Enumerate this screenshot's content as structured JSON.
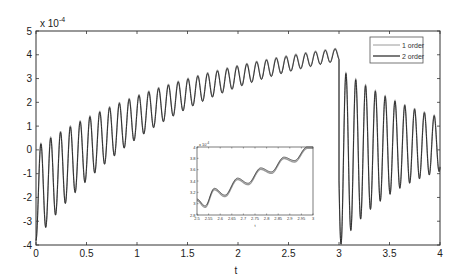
{
  "chart_data": [
    {
      "type": "line",
      "title": "",
      "xlabel": "t",
      "ylabel": "",
      "y_scale_label": "x 10",
      "y_scale_exponent": "-4",
      "xlim": [
        0,
        4
      ],
      "ylim": [
        -4,
        5
      ],
      "xticks": [
        "0",
        "0.5",
        "1",
        "1.5",
        "2",
        "2.5",
        "3",
        "3.5",
        "4"
      ],
      "yticks": [
        "-4",
        "-3",
        "-2",
        "-1",
        "0",
        "1",
        "2",
        "3",
        "4",
        "5"
      ],
      "grid": false,
      "legend_position": "upper right",
      "series": [
        {
          "name": "1 order",
          "color": "#9a9a9a",
          "description": "ramp with decaying ~10 Hz oscillation from t=0 to 3 (center ~-1.85 to 4.0), then step drop and damped oscillation about ~0 for t=3 to 4"
        },
        {
          "name": "2 order",
          "color": "#222222",
          "description": "nearly identical to 1 order"
        }
      ],
      "sample_points": {
        "t": [
          0.0,
          0.05,
          0.1,
          0.5,
          1.0,
          1.5,
          2.0,
          2.5,
          3.0,
          3.03,
          3.08,
          3.5,
          4.0
        ],
        "value": [
          -0.2,
          -3.7,
          0.0,
          -1.0,
          0.9,
          1.5,
          2.4,
          3.1,
          4.0,
          -3.9,
          2.9,
          0.5,
          1.0
        ]
      }
    },
    {
      "type": "line",
      "title": "",
      "xlabel": "t",
      "ylabel": "",
      "y_scale_label": "x 10",
      "y_scale_exponent": "-4",
      "xlim": [
        2.5,
        3
      ],
      "ylim": [
        2.8,
        4
      ],
      "xticks": [
        "2.5",
        "2.55",
        "2.6",
        "2.65",
        "2.7",
        "2.75",
        "2.8",
        "2.85",
        "2.9",
        "2.95",
        "3"
      ],
      "yticks": [
        "2.8",
        "3",
        "3.2",
        "3.4",
        "3.6",
        "3.8",
        "4"
      ],
      "grid": false,
      "series": [
        {
          "name": "1 order",
          "color": "#9a9a9a"
        },
        {
          "name": "2 order",
          "color": "#222222"
        }
      ],
      "sample_points": {
        "t": [
          2.5,
          2.535,
          2.575,
          2.62,
          2.675,
          2.72,
          2.775,
          2.82,
          2.875,
          2.92,
          2.975,
          3.0
        ],
        "value": [
          3.08,
          2.96,
          3.27,
          3.15,
          3.45,
          3.36,
          3.63,
          3.56,
          3.82,
          3.76,
          4.0,
          4.0
        ]
      }
    }
  ],
  "main": {
    "xlabel": "t",
    "scale_base": "x 10",
    "scale_exp": "-4",
    "legend": [
      {
        "label": "1 order"
      },
      {
        "label": "2 order"
      }
    ]
  },
  "inset": {
    "xlabel": "t",
    "scale_base": "x 10",
    "scale_exp": "-4"
  }
}
